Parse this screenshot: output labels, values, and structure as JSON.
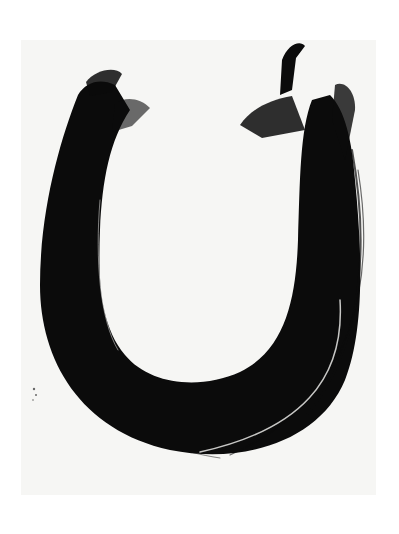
{
  "image": {
    "subject": "ink brush calligraphy stroke forming a U shape",
    "colors": {
      "ink": "#0b0b0b",
      "paper": "#f6f6f4",
      "background": "#ffffff"
    }
  }
}
